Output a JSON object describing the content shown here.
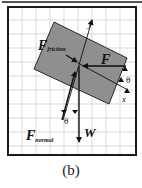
{
  "figure": {
    "caption": "(b)",
    "colors": {
      "background": "#ffffff",
      "grid": "#cfcfcf",
      "frame": "#1a1a1a",
      "block_fill": "#8f8f8f",
      "block_stroke": "#2a2a2a",
      "arrow": "#111111"
    },
    "labels": {
      "f_friction_main": "F",
      "f_friction_sub": "friction",
      "f_main": "F",
      "f_normal_main": "F",
      "f_normal_sub": "normal",
      "weight": "W",
      "axis_x": "x",
      "axis_y": "y",
      "theta_bottom": "θ",
      "theta_right": "θ"
    }
  }
}
